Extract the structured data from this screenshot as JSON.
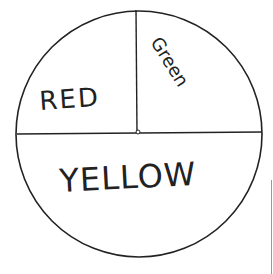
{
  "diagram": {
    "type": "spinner",
    "sections": [
      {
        "label": "RED",
        "share": "quarter",
        "position": "top-left"
      },
      {
        "label": "Green",
        "share": "quarter",
        "position": "top-right"
      },
      {
        "label": "YELLOW",
        "share": "half",
        "position": "bottom"
      }
    ],
    "colors": {
      "stroke": "#222222",
      "background": "#ffffff"
    }
  }
}
